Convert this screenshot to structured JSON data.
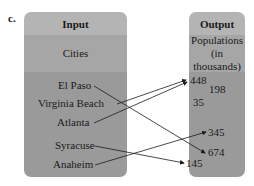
{
  "figure_label": "c.",
  "input": {
    "header": "Input",
    "subheader": "Cities",
    "items": [
      "El Paso",
      "Virginia Beach",
      "Atlanta",
      "Syracuse",
      "Anaheim"
    ]
  },
  "output": {
    "header": "Output",
    "subheader_line1": "Populations",
    "subheader_line2": "(in thousands)",
    "items": [
      "448",
      "198",
      "35",
      "345",
      "674",
      "145"
    ]
  },
  "mappings": [
    {
      "from": "El Paso",
      "to": "674"
    },
    {
      "from": "Virginia Beach",
      "to": "448"
    },
    {
      "from": "Atlanta",
      "to": "448"
    },
    {
      "from": "Syracuse",
      "to": "145"
    },
    {
      "from": "Anaheim",
      "to": "345"
    }
  ]
}
